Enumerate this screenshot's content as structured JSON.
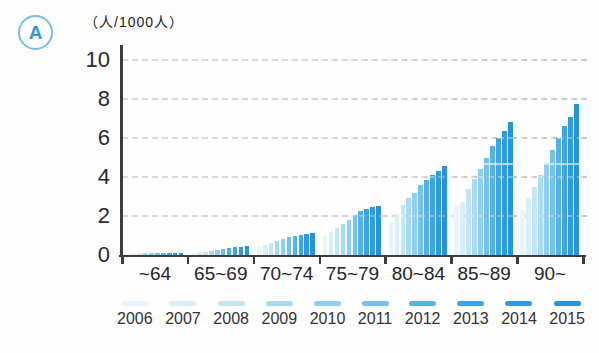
{
  "badge": {
    "label": "A"
  },
  "chart_data": {
    "type": "bar",
    "title": "",
    "unit_label": "（人/1000人）",
    "xlabel": "",
    "ylabel": "(人/1000人)",
    "ylim": [
      0,
      10
    ],
    "yticks": [
      0,
      2,
      4,
      6,
      8,
      10
    ],
    "grid": "dashed horizontal",
    "legend_position": "bottom",
    "categories": [
      "~64",
      "65~69",
      "70~74",
      "75~79",
      "80~84",
      "85~89",
      "90~"
    ],
    "series": [
      {
        "name": "2006",
        "color": "#eaf5fb",
        "values": [
          0.05,
          0.1,
          0.4,
          1.0,
          1.7,
          2.55,
          2.3
        ]
      },
      {
        "name": "2007",
        "color": "#d9eef9",
        "values": [
          0.06,
          0.13,
          0.5,
          1.2,
          2.1,
          2.7,
          2.9
        ]
      },
      {
        "name": "2008",
        "color": "#c3e5f6",
        "values": [
          0.07,
          0.16,
          0.6,
          1.4,
          2.55,
          3.4,
          3.5
        ]
      },
      {
        "name": "2009",
        "color": "#a9daf3",
        "values": [
          0.08,
          0.2,
          0.7,
          1.6,
          2.9,
          3.9,
          4.1
        ]
      },
      {
        "name": "2010",
        "color": "#8fcff0",
        "values": [
          0.09,
          0.25,
          0.8,
          1.8,
          3.2,
          4.4,
          4.7
        ]
      },
      {
        "name": "2011",
        "color": "#74c2ec",
        "values": [
          0.1,
          0.3,
          0.9,
          2.05,
          3.6,
          5.0,
          5.4
        ]
      },
      {
        "name": "2012",
        "color": "#55b1e8",
        "values": [
          0.1,
          0.35,
          1.0,
          2.25,
          3.85,
          5.6,
          6.0
        ]
      },
      {
        "name": "2013",
        "color": "#3ea5e4",
        "values": [
          0.11,
          0.4,
          1.05,
          2.35,
          4.1,
          6.0,
          6.6
        ]
      },
      {
        "name": "2014",
        "color": "#2f9ce1",
        "values": [
          0.12,
          0.43,
          1.1,
          2.45,
          4.3,
          6.35,
          7.1
        ]
      },
      {
        "name": "2015",
        "color": "#2693dd",
        "values": [
          0.12,
          0.45,
          1.15,
          2.5,
          4.55,
          6.8,
          7.75
        ]
      }
    ],
    "colors": {
      "axis": "#3c3c3c",
      "grid": "#c9c9c9",
      "badge_accent": "#2e96e2"
    }
  }
}
